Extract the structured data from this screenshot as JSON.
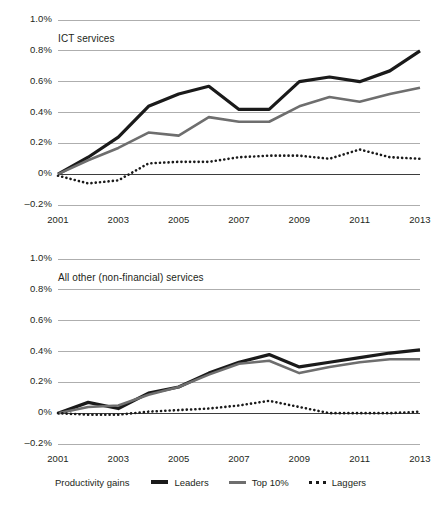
{
  "legend": {
    "title": "Productivity gains",
    "items": [
      {
        "label": "Leaders",
        "key": "solid-thick-black-line-icon",
        "color": "#1a1a1a"
      },
      {
        "label": "Top 10%",
        "key": "solid-gray-line-icon",
        "color": "#6e6e6e"
      },
      {
        "label": "Laggers",
        "key": "dotted-black-line-icon",
        "color": "#1a1a1a"
      }
    ]
  },
  "axis": {
    "y_ticks": [
      "1.0%",
      "0.8%",
      "0.6%",
      "0.4%",
      "0.2%",
      "0%",
      "–0.2%"
    ],
    "x_ticks": [
      "2001",
      "2003",
      "2005",
      "2007",
      "2009",
      "2011",
      "2013"
    ]
  },
  "chart_data": [
    {
      "type": "line",
      "title": "ICT services",
      "xlabel": "",
      "ylabel": "",
      "ylim": [
        -0.2,
        1.0
      ],
      "xlim": [
        2001,
        2013
      ],
      "ytick_values": [
        1.0,
        0.8,
        0.6,
        0.4,
        0.2,
        0.0,
        -0.2
      ],
      "ytick_labels": [
        "1.0%",
        "0.8%",
        "0.6%",
        "0.4%",
        "0.2%",
        "0%",
        "–0.2%"
      ],
      "xtick_values": [
        2001,
        2003,
        2005,
        2007,
        2009,
        2011,
        2013
      ],
      "xtick_labels": [
        "2001",
        "2003",
        "2005",
        "2007",
        "2009",
        "2011",
        "2013"
      ],
      "grid": "horizontal",
      "legend_position": "bottom-shared",
      "x": [
        2001,
        2002,
        2003,
        2004,
        2005,
        2006,
        2007,
        2008,
        2009,
        2010,
        2011,
        2012,
        2013
      ],
      "series": [
        {
          "name": "Leaders",
          "color": "#1a1a1a",
          "style": "solid",
          "width": 3.2,
          "values": [
            0.0,
            0.11,
            0.24,
            0.44,
            0.52,
            0.57,
            0.42,
            0.42,
            0.6,
            0.63,
            0.6,
            0.67,
            0.8
          ]
        },
        {
          "name": "Top 10%",
          "color": "#6e6e6e",
          "style": "solid",
          "width": 2.6,
          "values": [
            0.0,
            0.09,
            0.17,
            0.27,
            0.25,
            0.37,
            0.34,
            0.34,
            0.44,
            0.5,
            0.47,
            0.52,
            0.56
          ]
        },
        {
          "name": "Laggers",
          "color": "#1a1a1a",
          "style": "dotted",
          "width": 2.6,
          "values": [
            -0.01,
            -0.06,
            -0.04,
            0.07,
            0.08,
            0.08,
            0.11,
            0.12,
            0.12,
            0.1,
            0.16,
            0.11,
            0.1
          ]
        }
      ]
    },
    {
      "type": "line",
      "title": "All other (non-financial) services",
      "xlabel": "",
      "ylabel": "",
      "ylim": [
        -0.2,
        1.0
      ],
      "xlim": [
        2001,
        2013
      ],
      "ytick_values": [
        1.0,
        0.8,
        0.6,
        0.4,
        0.2,
        0.0,
        -0.2
      ],
      "ytick_labels": [
        "1.0%",
        "0.8%",
        "0.6%",
        "0.4%",
        "0.2%",
        "0%",
        "–0.2%"
      ],
      "xtick_values": [
        2001,
        2003,
        2005,
        2007,
        2009,
        2011,
        2013
      ],
      "xtick_labels": [
        "2001",
        "2003",
        "2005",
        "2007",
        "2009",
        "2011",
        "2013"
      ],
      "grid": "horizontal",
      "legend_position": "bottom-shared",
      "x": [
        2001,
        2002,
        2003,
        2004,
        2005,
        2006,
        2007,
        2008,
        2009,
        2010,
        2011,
        2012,
        2013
      ],
      "series": [
        {
          "name": "Leaders",
          "color": "#1a1a1a",
          "style": "solid",
          "width": 3.2,
          "values": [
            0.0,
            0.07,
            0.03,
            0.13,
            0.17,
            0.26,
            0.33,
            0.38,
            0.3,
            0.33,
            0.36,
            0.39,
            0.41
          ]
        },
        {
          "name": "Top 10%",
          "color": "#6e6e6e",
          "style": "solid",
          "width": 2.6,
          "values": [
            0.0,
            0.04,
            0.05,
            0.12,
            0.17,
            0.25,
            0.32,
            0.34,
            0.26,
            0.3,
            0.33,
            0.35,
            0.35
          ]
        },
        {
          "name": "Laggers",
          "color": "#1a1a1a",
          "style": "dotted",
          "width": 2.6,
          "values": [
            0.0,
            -0.01,
            -0.01,
            0.01,
            0.02,
            0.03,
            0.05,
            0.08,
            0.04,
            0.0,
            0.0,
            0.0,
            0.01
          ]
        }
      ]
    }
  ]
}
